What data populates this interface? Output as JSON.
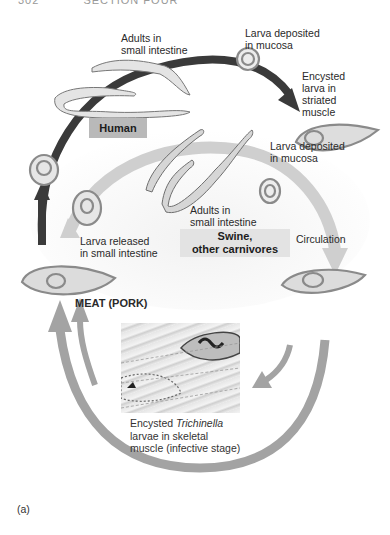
{
  "page_header": {
    "page_number": "302",
    "running_title": "SECTION FOUR"
  },
  "diagram": {
    "hosts": {
      "human": "Human",
      "swine": "Swine,\nother carnivores"
    },
    "labels": {
      "human_adults": "Adults in\nsmall intestine",
      "human_larva_deposited": "Larva deposited\nin mucosa",
      "encysted_striated": "Encysted\nlarva in\nstriated\nmuscle",
      "swine_larva_deposited": "Larva deposited\nin mucosa",
      "swine_adults": "Adults in\nsmall intestine",
      "larva_released": "Larva released\nin small intestine",
      "circulation": "Circulation",
      "meat": "MEAT (PORK)"
    },
    "photo_caption": {
      "line1_prefix": "Encysted ",
      "line1_italic": "Trichinella",
      "line2": "larvae in skeletal",
      "line3": "muscle (infective stage)"
    },
    "figure_label": "(a)",
    "colors": {
      "human_cycle_arrow": "#3a3a3a",
      "swine_cycle_arrow": "#c8c8c8",
      "outer_arrow": "#9a9a9a",
      "human_box": "#b9b9b9",
      "swine_box": "#e3e3e3",
      "cyst_fill": "#d9d9d9",
      "cyst_stroke": "#8a8a8a"
    }
  }
}
